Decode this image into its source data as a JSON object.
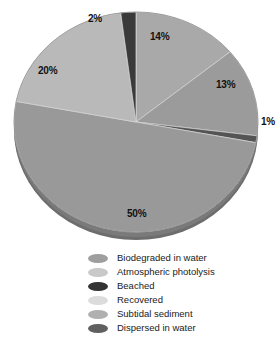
{
  "chart_data": {
    "type": "pie",
    "title": "",
    "subtitle": "",
    "xlabel": "",
    "ylabel": "",
    "grid": false,
    "legend_position": "bottom",
    "value_unit": "%",
    "start_angle_deg": 0,
    "direction": "clockwise",
    "categories": [
      "Biodegraded in water",
      "Atmospheric photolysis",
      "Dispersed in water",
      "Subtidal sediment",
      "Recovered",
      "Beached"
    ],
    "values": [
      14,
      13,
      1,
      50,
      20,
      2
    ],
    "slices": [
      {
        "label": "Biodegraded in water",
        "value": 14,
        "display": "14%",
        "color": "#a9a9a9",
        "start_deg": 0,
        "end_deg": 50.4,
        "label_x": 150,
        "label_y": 32
      },
      {
        "label": "Atmospheric photolysis",
        "value": 13,
        "display": "13%",
        "color": "#9b9b9b",
        "start_deg": 50.4,
        "end_deg": 97.2,
        "label_x": 216,
        "label_y": 80
      },
      {
        "label": "Dispersed in water",
        "value": 1,
        "display": "1%",
        "color": "#545454",
        "start_deg": 97.2,
        "end_deg": 100.8,
        "label_x": 261,
        "label_y": 117
      },
      {
        "label": "Subtidal sediment",
        "value": 50,
        "display": "50%",
        "color": "#999999",
        "start_deg": 100.8,
        "end_deg": 280.8,
        "label_x": 127,
        "label_y": 209
      },
      {
        "label": "Recovered",
        "value": 20,
        "display": "20%",
        "color": "#b9b9b9",
        "start_deg": 280.8,
        "end_deg": 352.8,
        "label_x": 38,
        "label_y": 66
      },
      {
        "label": "Beached",
        "value": 2,
        "display": "2%",
        "color": "#3a3a3a",
        "start_deg": 352.8,
        "end_deg": 360,
        "label_x": 88,
        "label_y": 14
      }
    ],
    "legend": [
      {
        "label": "Biodegraded in water",
        "color": "#9e9e9e"
      },
      {
        "label": "Atmospheric photolysis",
        "color": "#c9c9c9"
      },
      {
        "label": "Beached",
        "color": "#333333"
      },
      {
        "label": "Recovered",
        "color": "#dcdcdc"
      },
      {
        "label": "Subtidal sediment",
        "color": "#b0b0b0"
      },
      {
        "label": "Dispersed in water",
        "color": "#606060"
      }
    ]
  },
  "style": {
    "background": "#ffffff",
    "text_color": "#1a1a1a",
    "depth_shadow": "#5f5f5f"
  }
}
